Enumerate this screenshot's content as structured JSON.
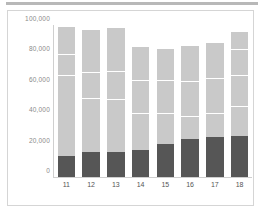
{
  "chart_data": {
    "type": "bar",
    "title": "",
    "subtitle": "",
    "xlabel": "",
    "ylabel": "",
    "stacked": true,
    "grid": false,
    "legend": "none",
    "ylim": [
      0,
      100000
    ],
    "yticks": [
      0,
      20000,
      40000,
      60000,
      80000,
      100000
    ],
    "ytick_labels": [
      "0",
      "20,000",
      "40,000",
      "60,000",
      "80,000",
      "100,000"
    ],
    "categories": [
      "11",
      "12",
      "13",
      "14",
      "15",
      "16",
      "17",
      "18"
    ],
    "series": [
      {
        "name": "segment-1",
        "color": "#565656",
        "values": [
          14000,
          16200,
          16600,
          17800,
          21800,
          25200,
          26200,
          26800
        ]
      },
      {
        "name": "segment-2",
        "color": "#c9c9c9",
        "values": [
          53000,
          36000,
          35000,
          24000,
          20000,
          15000,
          16000,
          20000
        ]
      },
      {
        "name": "segment-3",
        "color": "#c9c9c9",
        "values": [
          14000,
          17000,
          18000,
          22000,
          22000,
          23000,
          23000,
          20000
        ]
      },
      {
        "name": "segment-4",
        "color": "#c9c9c9",
        "values": [
          18500,
          28500,
          29400,
          22200,
          21200,
          23800,
          23800,
          17200
        ]
      },
      {
        "name": "segment-5",
        "color": "#c9c9c9",
        "values": [
          0,
          0,
          0,
          0,
          0,
          0,
          0,
          12000
        ]
      }
    ],
    "totals": [
      99500,
      97700,
      99000,
      86000,
      85000,
      87000,
      89000,
      96000
    ],
    "colors": {
      "dark_segment": "#565656",
      "light_segment": "#c9c9c9",
      "separator": "#ffffff",
      "axis": "#cfcfcf",
      "tick_text": "#8a8a8a",
      "category_text": "#555555",
      "frame_border": "#d5d5d5",
      "top_strip": "#b8b8b8",
      "background": "#ffffff"
    }
  }
}
